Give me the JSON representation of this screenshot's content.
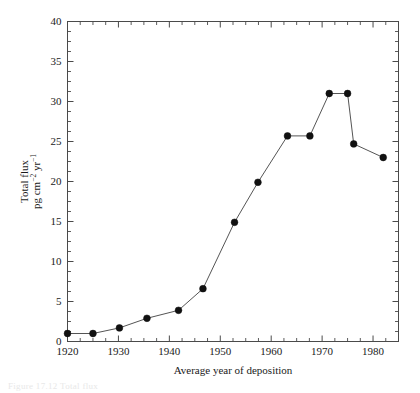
{
  "figure": {
    "background": "#ffffff",
    "line_color": "#555555",
    "marker_color": "#111111",
    "axis_color": "#4a4a4a"
  },
  "axes": {
    "x": {
      "label": "Average year of deposition",
      "min": 1920,
      "max": 1985,
      "major_ticks": [
        1920,
        1930,
        1940,
        1950,
        1960,
        1970,
        1980
      ],
      "tick_labels": [
        "1920",
        "1930",
        "1940",
        "1950",
        "1960",
        "1970",
        "1980"
      ],
      "minor_step": 2.5
    },
    "y": {
      "label_line1": "Total flux",
      "label_line2_pre": "pg cm",
      "label_line2_sup1": "−2",
      "label_line2_mid": " yr",
      "label_line2_sup2": "−1",
      "min": 0,
      "max": 40,
      "major_ticks": [
        0,
        5,
        10,
        15,
        20,
        25,
        30,
        35,
        40
      ],
      "tick_labels": [
        "0",
        "5",
        "10",
        "15",
        "20",
        "25",
        "30",
        "35",
        "40"
      ],
      "minor_step": 1.25
    }
  },
  "caption": "Figure 17.12  Total flux",
  "chart_data": {
    "type": "line",
    "title": "",
    "xlabel": "Average year of deposition",
    "ylabel": "Total flux pg cm−2 yr−1",
    "xlim": [
      1920,
      1985
    ],
    "ylim": [
      0,
      40
    ],
    "grid": false,
    "legend": null,
    "markers": "filled-circle",
    "x": [
      1920.0,
      1925.0,
      1930.2,
      1935.6,
      1941.8,
      1946.6,
      1952.8,
      1957.4,
      1963.2,
      1967.6,
      1971.4,
      1975.0,
      1976.2,
      1982.0
    ],
    "values": [
      1.0,
      1.0,
      1.7,
      2.9,
      3.9,
      6.6,
      14.9,
      19.9,
      25.7,
      25.7,
      31.0,
      31.0,
      24.7,
      23.0
    ],
    "series": [
      {
        "name": "Total flux",
        "points": [
          {
            "x": 1920.0,
            "y": 1.0
          },
          {
            "x": 1925.0,
            "y": 1.0
          },
          {
            "x": 1930.2,
            "y": 1.7
          },
          {
            "x": 1935.6,
            "y": 2.9
          },
          {
            "x": 1941.8,
            "y": 3.9
          },
          {
            "x": 1946.6,
            "y": 6.6
          },
          {
            "x": 1952.8,
            "y": 14.9
          },
          {
            "x": 1957.4,
            "y": 19.9
          },
          {
            "x": 1963.2,
            "y": 25.7
          },
          {
            "x": 1967.6,
            "y": 25.7
          },
          {
            "x": 1971.4,
            "y": 31.0
          },
          {
            "x": 1975.0,
            "y": 31.0
          },
          {
            "x": 1976.2,
            "y": 24.7
          },
          {
            "x": 1982.0,
            "y": 23.0
          }
        ]
      }
    ]
  }
}
